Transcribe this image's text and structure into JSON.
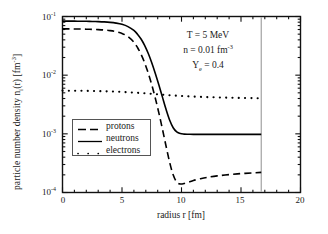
{
  "chart_data": {
    "type": "line",
    "title": "",
    "xlabel": "radius  r  [fm]",
    "ylabel": "particle number density  n",
    "ylabel_sub": "i",
    "ylabel_tail": "(r)  [fm",
    "ylabel_exp": "-3",
    "ylabel_close": "]",
    "xlim": [
      0,
      20
    ],
    "ylim": [
      0.0001,
      0.1
    ],
    "yscale": "log",
    "xscale": "linear",
    "grid": false,
    "legend_position": "center-left",
    "xticks": [
      0,
      5,
      10,
      15,
      20
    ],
    "xtick_labels": [
      "0",
      "5",
      "10",
      "15",
      "20"
    ],
    "xminor_step": 1,
    "yticks": [
      0.1,
      0.01,
      0.001,
      0.0001
    ],
    "ytick_labels": [
      "10",
      "10",
      "10",
      "10"
    ],
    "ytick_exponents": [
      "-1",
      "-2",
      "-3",
      "-4"
    ],
    "cell_boundary_r": 16.7,
    "annotations": [
      {
        "text": "T = 5 MeV",
        "x": 10.4,
        "y": 0.042
      },
      {
        "text_pre": "n = 0.01 fm",
        "text_exp": "-3",
        "x": 10.4,
        "y": 0.026
      },
      {
        "text_pre": "Y",
        "text_sub": "e",
        "text_post": " = 0.4",
        "x": 10.4,
        "y": 0.016
      }
    ],
    "series": [
      {
        "name": "protons",
        "style": "dashed",
        "color": "#000000",
        "legend_label": "protons",
        "x": [
          0.0,
          0.5,
          1.0,
          1.5,
          2.0,
          2.5,
          3.0,
          3.5,
          4.0,
          4.5,
          5.0,
          5.5,
          6.0,
          6.3,
          6.6,
          6.9,
          7.2,
          7.5,
          7.8,
          8.1,
          8.4,
          8.7,
          9.0,
          9.3,
          9.6,
          9.9,
          10.2,
          10.6,
          11.0,
          11.6,
          12.2,
          13.0,
          14.0,
          15.0,
          16.0,
          16.7
        ],
        "y": [
          0.0615,
          0.0615,
          0.0613,
          0.0611,
          0.0608,
          0.0604,
          0.0598,
          0.0589,
          0.0575,
          0.0552,
          0.0515,
          0.0455,
          0.0365,
          0.0296,
          0.0227,
          0.0163,
          0.0109,
          0.00685,
          0.00405,
          0.00226,
          0.0012,
          0.00062,
          0.00033,
          0.0002,
          0.00015,
          0.00014,
          0.000142,
          0.00015,
          0.00016,
          0.000172,
          0.000182,
          0.000192,
          0.000202,
          0.00021,
          0.000216,
          0.00022
        ]
      },
      {
        "name": "neutrons",
        "style": "solid",
        "color": "#000000",
        "legend_label": "neutrons",
        "x": [
          0.0,
          0.5,
          1.0,
          1.5,
          2.0,
          2.5,
          3.0,
          3.5,
          4.0,
          4.5,
          5.0,
          5.5,
          6.0,
          6.3,
          6.6,
          6.9,
          7.2,
          7.5,
          7.8,
          8.1,
          8.4,
          8.7,
          9.0,
          9.3,
          9.6,
          9.9,
          10.2,
          10.6,
          11.0,
          12.0,
          13.0,
          14.0,
          15.0,
          16.0,
          16.7
        ],
        "y": [
          0.0835,
          0.0835,
          0.0833,
          0.0831,
          0.0828,
          0.0824,
          0.0818,
          0.0809,
          0.0795,
          0.0772,
          0.0735,
          0.0673,
          0.0578,
          0.05,
          0.0413,
          0.0322,
          0.0236,
          0.0163,
          0.0107,
          0.0068,
          0.00422,
          0.00262,
          0.00172,
          0.00127,
          0.00108,
          0.00101,
          0.00099,
          0.000985,
          0.00098,
          0.00098,
          0.00098,
          0.00098,
          0.00098,
          0.00098,
          0.00098
        ]
      },
      {
        "name": "electrons",
        "style": "dotted",
        "color": "#000000",
        "legend_label": "electrons",
        "x": [
          0.0,
          1.0,
          2.0,
          3.0,
          4.0,
          5.0,
          6.0,
          7.0,
          8.0,
          9.0,
          10.0,
          11.0,
          12.0,
          13.0,
          14.0,
          15.0,
          16.0,
          16.7
        ],
        "y": [
          0.00545,
          0.00543,
          0.0054,
          0.00535,
          0.00528,
          0.00518,
          0.00505,
          0.0049,
          0.00472,
          0.00455,
          0.00442,
          0.00432,
          0.00424,
          0.00418,
          0.00413,
          0.00409,
          0.00406,
          0.00404
        ]
      }
    ]
  },
  "axis": {
    "xlabel_text": "radius   r   [fm]",
    "ylabel_parts": {
      "main": "particle number density  n",
      "sub": "i",
      "mid": "(r)  [fm",
      "exp": "-3",
      "end": "]"
    }
  }
}
